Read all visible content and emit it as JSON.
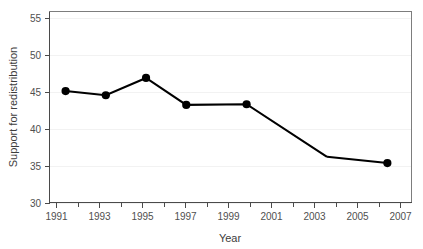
{
  "chart_data": {
    "type": "line",
    "title": "",
    "subtitle": "",
    "xlabel": "Year",
    "ylabel": "Support for redistribution",
    "xlim": [
      1990.2,
      2008.2
    ],
    "ylim": [
      28.6,
      56.2
    ],
    "grid": false,
    "legend": null,
    "x": [
      1991,
      1993,
      1995,
      1997,
      2000,
      2004,
      2007
    ],
    "values": [
      44.7,
      44.1,
      46.6,
      42.7,
      42.8,
      35.2,
      34.3
    ],
    "series": [
      {
        "name": "Support for redistribution",
        "x": [
          1991,
          1993,
          1995,
          1997,
          2000,
          2004,
          2007
        ],
        "values": [
          44.7,
          44.1,
          46.6,
          42.7,
          42.8,
          35.2,
          34.3
        ],
        "marker_shown": [
          true,
          true,
          true,
          true,
          true,
          false,
          true
        ],
        "color": "#000000"
      }
    ],
    "xticks": [
      1991,
      1993,
      1995,
      1997,
      1999,
      2001,
      2003,
      2005,
      2007
    ],
    "xtick_labels": [
      "1991",
      "1993",
      "1995",
      "1997",
      "1999",
      "2001",
      "2003",
      "2005",
      "2007"
    ],
    "xticks_minor": [
      1992,
      1994,
      1996,
      1998,
      2000,
      2002,
      2004,
      2006
    ],
    "yticks": [
      30,
      35,
      40,
      45,
      50,
      55
    ],
    "ytick_labels": [
      "30",
      "35",
      "40",
      "45",
      "50",
      "55"
    ],
    "colors": {
      "line": "#000000",
      "marker": "#000000",
      "panel_border": "#7d7d7d",
      "axis": "#4a4a4a",
      "tick_text": "#4f4f4f",
      "title_text": "#3d3d3d",
      "background": "#ffffff"
    }
  },
  "axes": {
    "x_title": "Year",
    "y_title": "Support for redistribution"
  }
}
